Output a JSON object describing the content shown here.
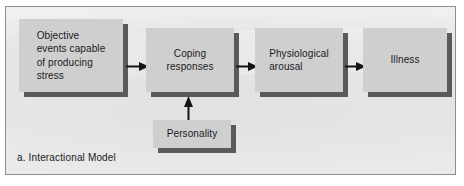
{
  "figure": {
    "caption": "a. Interactional Model",
    "panel_background": "#e2e2e2",
    "panel_border": "#8d8d8d",
    "box_fill": "#cfcfcf",
    "box_shadow": "#5a5a5a",
    "text_color": "#1a1a1a",
    "arrow_color": "#141414"
  },
  "nodes": [
    {
      "id": "stressors",
      "label": "Objective\nevents capable\nof producing\nstress"
    },
    {
      "id": "coping",
      "label": "Coping\nresponses"
    },
    {
      "id": "arousal",
      "label": "Physiological\narousal"
    },
    {
      "id": "illness",
      "label": "Illness"
    },
    {
      "id": "personality",
      "label": "Personality"
    }
  ],
  "arrows": [
    {
      "id": "stressors-to-coping",
      "direction": "right",
      "from": "stressors",
      "to": "coping"
    },
    {
      "id": "coping-to-arousal",
      "direction": "right",
      "from": "coping",
      "to": "arousal"
    },
    {
      "id": "arousal-to-illness",
      "direction": "right",
      "from": "arousal",
      "to": "illness"
    },
    {
      "id": "personality-to-coping",
      "direction": "up",
      "from": "personality",
      "to": "coping"
    }
  ]
}
